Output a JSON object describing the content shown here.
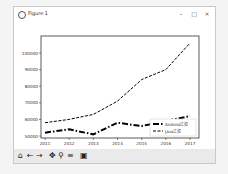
{
  "window": {
    "title": "Figure 1",
    "minimize_label": "–",
    "maximize_label": "□",
    "close_label": "×"
  },
  "toolbar": {
    "buttons": [
      {
        "name": "home",
        "glyph": "⌂"
      },
      {
        "name": "back",
        "glyph": "←"
      },
      {
        "name": "forward",
        "glyph": "→"
      },
      {
        "name": "pan",
        "glyph": "✥"
      },
      {
        "name": "zoom",
        "glyph": "⚲"
      },
      {
        "name": "configure-subplots",
        "glyph": "≡"
      },
      {
        "name": "save",
        "glyph": "▣"
      }
    ]
  },
  "chart_data": {
    "type": "line",
    "title": "",
    "xlabel": "",
    "ylabel": "",
    "x": [
      2011,
      2012,
      2013,
      2014,
      2015,
      2016,
      2017
    ],
    "series": [
      {
        "name": "Android工资",
        "style": "dashdot",
        "color": "#000000",
        "values": [
          52000,
          54000,
          51000,
          58000,
          56000,
          59000,
          62000
        ]
      },
      {
        "name": "Java工资",
        "style": "dashed",
        "color": "#000000",
        "values": [
          58000,
          60000,
          63000,
          71000,
          84000,
          90000,
          106000
        ]
      }
    ],
    "yticks": [
      50000,
      60000,
      70000,
      80000,
      90000,
      100000
    ],
    "xticks": [
      "2011",
      "2012",
      "2013",
      "2014",
      "2015",
      "2016",
      "2017"
    ],
    "ylim": [
      48000,
      109000
    ],
    "grid": false,
    "legend_position": "lower right"
  }
}
